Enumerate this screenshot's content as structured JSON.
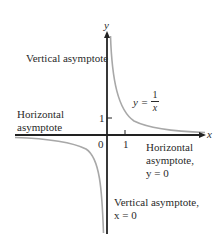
{
  "figure": {
    "axes": {
      "x_label": "x",
      "y_label": "y",
      "origin_label": "0",
      "x_tick_label": "1",
      "y_tick_label": "1"
    },
    "function_label": {
      "lhs": "y =",
      "numerator": "1",
      "denominator": "x"
    },
    "annotations": {
      "vertical_asymptote_top": "Vertical asymptote",
      "horizontal_asymptote_left_line1": "Horizontal",
      "horizontal_asymptote_left_line2": "asymptote",
      "horizontal_asymptote_right_line1": "Horizontal",
      "horizontal_asymptote_right_line2": "asymptote,",
      "horizontal_asymptote_right_line3": "y = 0",
      "vertical_asymptote_bottom_line1": "Vertical asymptote,",
      "vertical_asymptote_bottom_line2": "x = 0"
    },
    "colors": {
      "axis": "#222222",
      "curve": "#a8a8a8",
      "text": "#2a2a2a"
    }
  }
}
